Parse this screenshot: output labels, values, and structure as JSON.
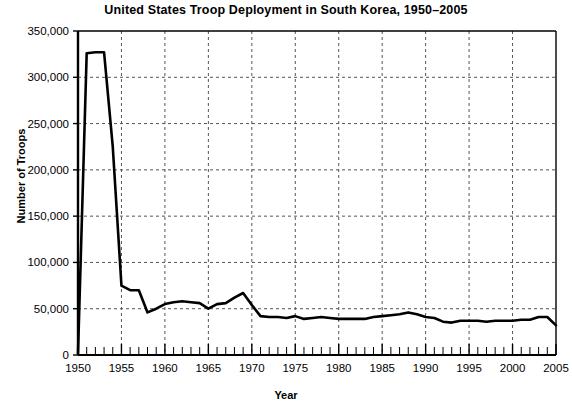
{
  "chart_data": {
    "type": "line",
    "title": "United States Troop Deployment in South Korea, 1950–2005",
    "xlabel": "Year",
    "ylabel": "Number of Troops",
    "xlim": [
      1950,
      2005
    ],
    "ylim": [
      0,
      350000
    ],
    "grid": true,
    "legend": "none",
    "y_ticks": [
      0,
      50000,
      100000,
      150000,
      200000,
      250000,
      300000,
      350000
    ],
    "y_tick_labels": [
      "0",
      "50,000",
      "100,000",
      "150,000",
      "200,000",
      "250,000",
      "300,000",
      "350,000"
    ],
    "x_ticks": [
      1950,
      1955,
      1960,
      1965,
      1970,
      1975,
      1980,
      1985,
      1990,
      1995,
      2000,
      2005
    ],
    "x_tick_labels": [
      "1950",
      "1955",
      "1960",
      "1965",
      "1970",
      "1975",
      "1980",
      "1985",
      "1990",
      "1995",
      "2000",
      "2005"
    ],
    "x_minor_tick_interval": 1,
    "series": [
      {
        "name": "US troops in South Korea",
        "color": "#000000",
        "x": [
          1950,
          1951,
          1952,
          1953,
          1954,
          1955,
          1956,
          1957,
          1958,
          1959,
          1960,
          1961,
          1962,
          1963,
          1964,
          1965,
          1966,
          1967,
          1968,
          1969,
          1970,
          1971,
          1972,
          1973,
          1974,
          1975,
          1976,
          1977,
          1978,
          1979,
          1980,
          1981,
          1982,
          1983,
          1984,
          1985,
          1986,
          1987,
          1988,
          1989,
          1990,
          1991,
          1992,
          1993,
          1994,
          1995,
          1996,
          1997,
          1998,
          1999,
          2000,
          2001,
          2002,
          2003,
          2004,
          2005
        ],
        "values": [
          2000,
          326000,
          327000,
          327000,
          225000,
          75000,
          70000,
          70000,
          46000,
          50000,
          55000,
          57000,
          58000,
          57000,
          56000,
          50000,
          55000,
          56000,
          62000,
          67000,
          54000,
          42000,
          41000,
          41000,
          40000,
          42000,
          39000,
          40000,
          41000,
          40000,
          39000,
          39000,
          39000,
          39000,
          41000,
          42000,
          43000,
          44000,
          46000,
          44000,
          41000,
          40000,
          36000,
          35000,
          37000,
          37000,
          37000,
          36000,
          37000,
          37000,
          37000,
          38000,
          38000,
          41000,
          41000,
          32000
        ]
      }
    ]
  },
  "bottom_artifact": {
    "text": ""
  }
}
